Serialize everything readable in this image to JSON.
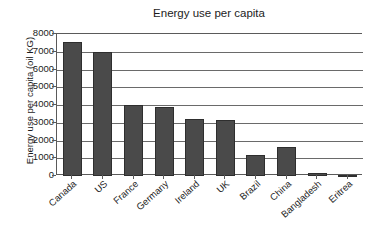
{
  "chart_data": {
    "type": "bar",
    "title": "Energy use per capita",
    "xlabel": "",
    "ylabel": "Energy use per capita (oil KG)",
    "categories": [
      "Canada",
      "US",
      "France",
      "Germany",
      "Ireland",
      "UK",
      "Brazil",
      "China",
      "Bangladesh",
      "Eritrea"
    ],
    "values": [
      7550,
      7000,
      4000,
      3880,
      3200,
      3150,
      1200,
      1650,
      160,
      80
    ],
    "ylim": [
      0,
      8000
    ],
    "yticks": [
      0,
      1000,
      2000,
      3000,
      4000,
      5000,
      6000,
      7000,
      8000
    ],
    "ytick_labels": [
      "0",
      "1000",
      "2000",
      "3000",
      "4000",
      "5000",
      "6000",
      "7000",
      "8000"
    ],
    "grid": true,
    "legend": false,
    "bar_color": "#4a4a4a",
    "bar_edge_color": "#2e2e2e",
    "background_color": "#ffffff",
    "axis_color": "#5a5a5a"
  }
}
